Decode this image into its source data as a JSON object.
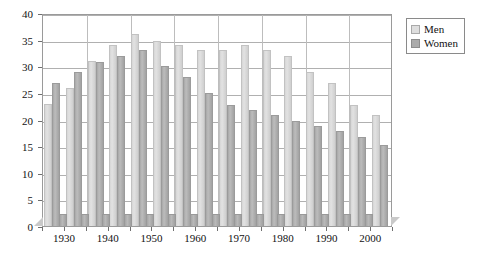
{
  "chart_data": {
    "type": "bar",
    "title": "",
    "subtitle": "",
    "xlabel": "",
    "ylabel": "",
    "grid": true,
    "legend_position": "top-right",
    "ylim": [
      0,
      40
    ],
    "ytick_step": 5,
    "ytick_labels": [
      "0",
      "5",
      "10",
      "15",
      "20",
      "25",
      "30",
      "35",
      "40"
    ],
    "xlim": [
      1925,
      2005
    ],
    "xtick_labels": [
      "1930",
      "1940",
      "1950",
      "1960",
      "1970",
      "1980",
      "1990",
      "2000"
    ],
    "xtick_values": [
      1930,
      1940,
      1950,
      1960,
      1970,
      1980,
      1990,
      2000
    ],
    "xminor_values": [
      1925,
      1935,
      1945,
      1955,
      1965,
      1975,
      1985,
      1995,
      2005
    ],
    "categories": [
      1927,
      1932,
      1937,
      1942,
      1947,
      1952,
      1957,
      1962,
      1967,
      1972,
      1977,
      1982,
      1987,
      1992,
      1997,
      2002
    ],
    "series": [
      {
        "name": "Men",
        "color": "#dedede",
        "values": [
          23,
          26,
          31,
          34,
          36,
          34.7,
          34,
          33,
          33,
          34,
          33,
          32,
          29,
          26.8,
          22.8,
          20.8
        ]
      },
      {
        "name": "Women",
        "color": "#ababab",
        "values": [
          26.8,
          29,
          30.8,
          32,
          33,
          30,
          28,
          25,
          22.8,
          21.8,
          20.8,
          19.7,
          18.8,
          17.8,
          16.8,
          15.3
        ]
      }
    ],
    "minor_markers": {
      "name": "Women",
      "color": "#ababab",
      "x": [
        1929.5,
        1934.5,
        1939.5,
        1944.5,
        1949.5,
        1954.5,
        1959.5,
        1964.5,
        1969.5,
        1974.5,
        1979.5,
        1984.5,
        1989.5,
        1994.5,
        1999.5
      ],
      "value": 2.3
    }
  },
  "legend": {
    "items": [
      {
        "label": "Men",
        "swatch": "men"
      },
      {
        "label": "Women",
        "swatch": "women"
      }
    ]
  }
}
